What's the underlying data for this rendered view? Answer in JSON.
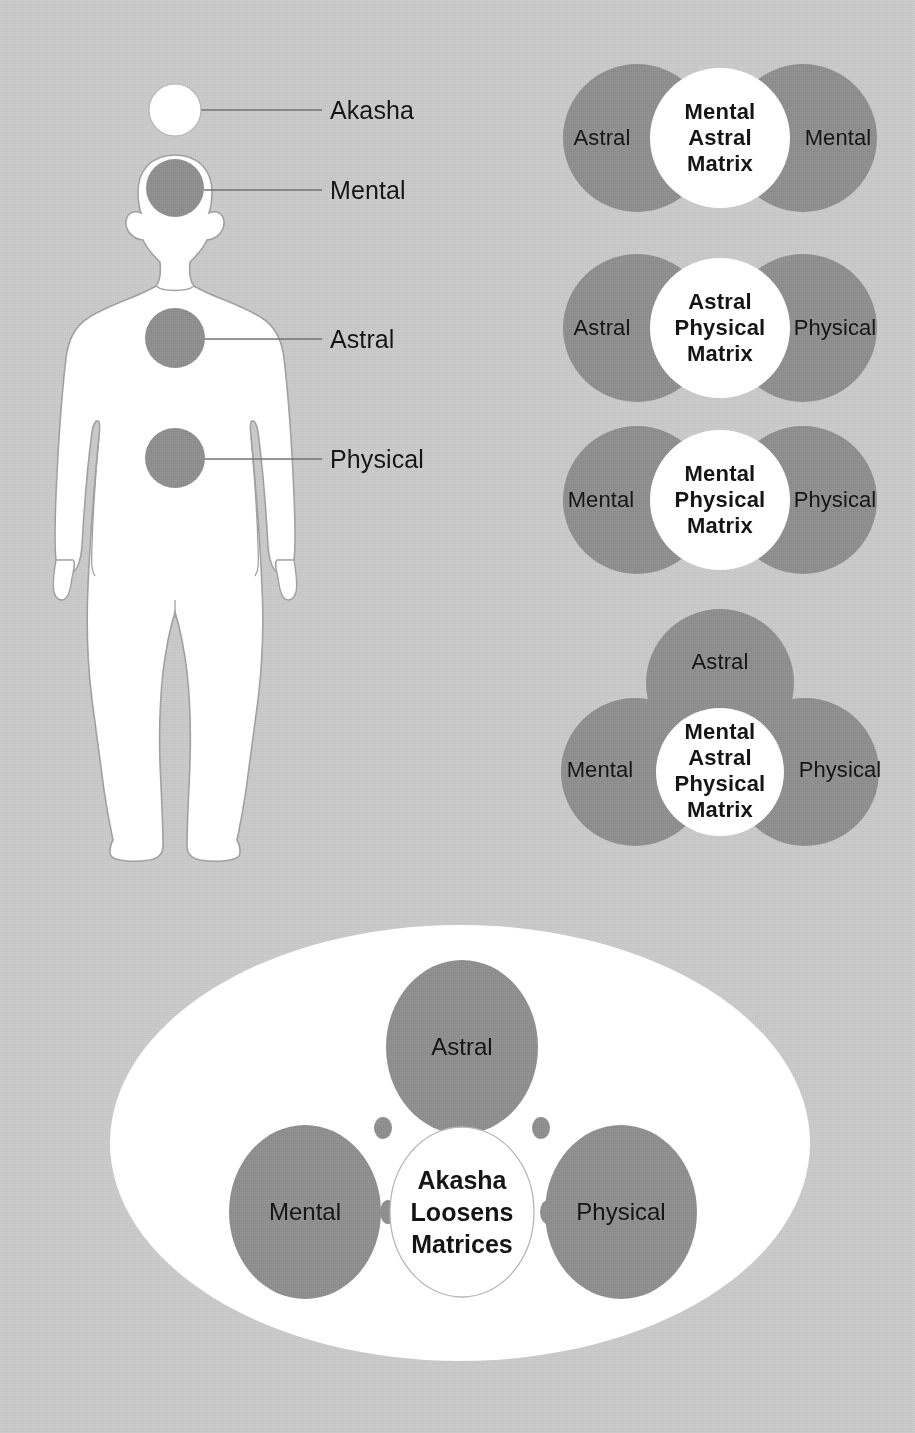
{
  "colors": {
    "background": "#c7c7c7",
    "lobe_gray": "#8b8b8b",
    "core_white": "#ffffff",
    "outline_gray": "#9a9a9a",
    "text": "#141414",
    "ellipse_white": "#ffffff"
  },
  "body_map": {
    "title": "human-figure-callouts",
    "callouts": [
      {
        "label": "Akasha",
        "marker": "white-circle",
        "marker_x": 175,
        "marker_y": 110,
        "marker_r": 26,
        "line_x1": 201,
        "line_x2": 322,
        "line_y": 110,
        "text_x": 330,
        "text_y": 110
      },
      {
        "label": "Mental",
        "marker": "gray-circle",
        "marker_x": 175,
        "marker_y": 188,
        "marker_r": 29,
        "line_x1": 204,
        "line_x2": 322,
        "line_y": 190,
        "text_x": 330,
        "text_y": 190
      },
      {
        "label": "Astral",
        "marker": "gray-circle",
        "marker_x": 175,
        "marker_y": 338,
        "marker_r": 30,
        "line_x1": 205,
        "line_x2": 322,
        "line_y": 339,
        "text_x": 330,
        "text_y": 339
      },
      {
        "label": "Physical",
        "marker": "gray-circle",
        "marker_x": 175,
        "marker_y": 458,
        "marker_r": 30,
        "line_x1": 205,
        "line_x2": 322,
        "line_y": 459,
        "text_x": 330,
        "text_y": 459
      }
    ]
  },
  "matrices": [
    {
      "id": "mental-astral-matrix",
      "layout": "two-lobe",
      "left_lobe": "Astral",
      "right_lobe": "Mental",
      "core_lines": [
        "Mental",
        "Astral",
        "Matrix"
      ],
      "cy": 138,
      "left_cx": 637,
      "right_cx": 803,
      "core_cx": 720,
      "lobe_r": 74,
      "core_r": 70
    },
    {
      "id": "astral-physical-matrix",
      "layout": "two-lobe",
      "left_lobe": "Astral",
      "right_lobe": "Physical",
      "core_lines": [
        "Astral",
        "Physical",
        "Matrix"
      ],
      "cy": 328,
      "left_cx": 637,
      "right_cx": 803,
      "core_cx": 720,
      "lobe_r": 74,
      "core_r": 70
    },
    {
      "id": "mental-physical-matrix",
      "layout": "two-lobe",
      "left_lobe": "Mental",
      "right_lobe": "Physical",
      "core_lines": [
        "Mental",
        "Physical",
        "Matrix"
      ],
      "cy": 500,
      "left_cx": 637,
      "right_cx": 803,
      "core_cx": 720,
      "lobe_r": 74,
      "core_r": 70
    },
    {
      "id": "mental-astral-physical-matrix",
      "layout": "three-lobe",
      "top_lobe": "Astral",
      "left_lobe": "Mental",
      "right_lobe": "Physical",
      "core_lines": [
        "Mental",
        "Astral",
        "Physical",
        "Matrix"
      ],
      "top_cx": 720,
      "top_cy": 683,
      "left_cx": 635,
      "left_cy": 770,
      "right_cx": 805,
      "right_cy": 770,
      "core_cx": 720,
      "core_cy": 770,
      "lobe_r": 74,
      "core_r": 64
    }
  ],
  "akasha_diagram": {
    "id": "akasha-loosens-matrices",
    "ellipse": {
      "cx": 460,
      "cy": 1143,
      "rx": 350,
      "ry": 218
    },
    "lobes": [
      {
        "label": "Astral",
        "cx": 462,
        "cy": 1047,
        "rx": 76,
        "ry": 87
      },
      {
        "label": "Mental",
        "cx": 305,
        "cy": 1212,
        "rx": 76,
        "ry": 87
      },
      {
        "label": "Physical",
        "cx": 621,
        "cy": 1212,
        "rx": 76,
        "ry": 87
      }
    ],
    "core": {
      "lines": [
        "Akasha",
        "Loosens",
        "Matrices"
      ],
      "cx": 462,
      "cy": 1212,
      "rx": 72,
      "ry": 85
    },
    "connector_dots": [
      {
        "cx": 383,
        "cy": 1128,
        "rx": 9,
        "ry": 11
      },
      {
        "cx": 462,
        "cy": 1130,
        "rx": 12,
        "ry": 10
      },
      {
        "cx": 541,
        "cy": 1128,
        "rx": 9,
        "ry": 11
      },
      {
        "cx": 388,
        "cy": 1212,
        "rx": 8,
        "ry": 12
      },
      {
        "cx": 548,
        "cy": 1212,
        "rx": 8,
        "ry": 12
      }
    ]
  }
}
